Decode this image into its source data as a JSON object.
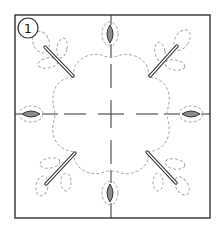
{
  "diagram": {
    "step_number": "1",
    "colors": {
      "border": "#333333",
      "centerline": "#333333",
      "dashed_outline": "#aaaaaa",
      "leaf_fill": "#8c8c8c",
      "leaf_stroke": "#333333",
      "stem_stroke": "#333333",
      "stem_fill": "#ffffff",
      "background": "#ffffff"
    },
    "frame": {
      "x": 15,
      "y": 15,
      "width": 195,
      "height": 203
    },
    "center": {
      "x": 111,
      "y": 114
    },
    "solid_leaves": [
      {
        "position": "top",
        "cx": 110,
        "cy": 34,
        "rx": 4.5,
        "ry": 8.5,
        "rotate": 0
      },
      {
        "position": "bottom",
        "cx": 110,
        "cy": 193,
        "rx": 4.5,
        "ry": 8.5,
        "rotate": 0
      },
      {
        "position": "left",
        "cx": 31,
        "cy": 114,
        "rx": 8.5,
        "ry": 4.5,
        "rotate": 0
      },
      {
        "position": "right",
        "cx": 191,
        "cy": 114,
        "rx": 8.5,
        "ry": 4.5,
        "rotate": 0
      }
    ],
    "stems": [
      {
        "position": "top-left",
        "x1": 45,
        "y1": 47,
        "x2": 73,
        "y2": 76
      },
      {
        "position": "top-right",
        "x1": 150,
        "y1": 76,
        "x2": 177,
        "y2": 46
      },
      {
        "position": "bottom-left",
        "x1": 46,
        "y1": 184,
        "x2": 75,
        "y2": 153
      },
      {
        "position": "bottom-right",
        "x1": 147,
        "y1": 152,
        "x2": 176,
        "y2": 183
      }
    ]
  }
}
